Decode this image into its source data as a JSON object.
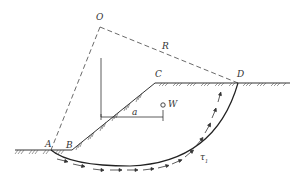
{
  "diagram": {
    "type": "slope-stability-slip-circle",
    "labels": {
      "O": "O",
      "R": "R",
      "C": "C",
      "D": "D",
      "W": "W",
      "a": "a",
      "A": "A",
      "B": "B",
      "tau": "τ",
      "tau_sub": "1"
    },
    "colors": {
      "line": "#333333",
      "background": "#ffffff"
    }
  }
}
